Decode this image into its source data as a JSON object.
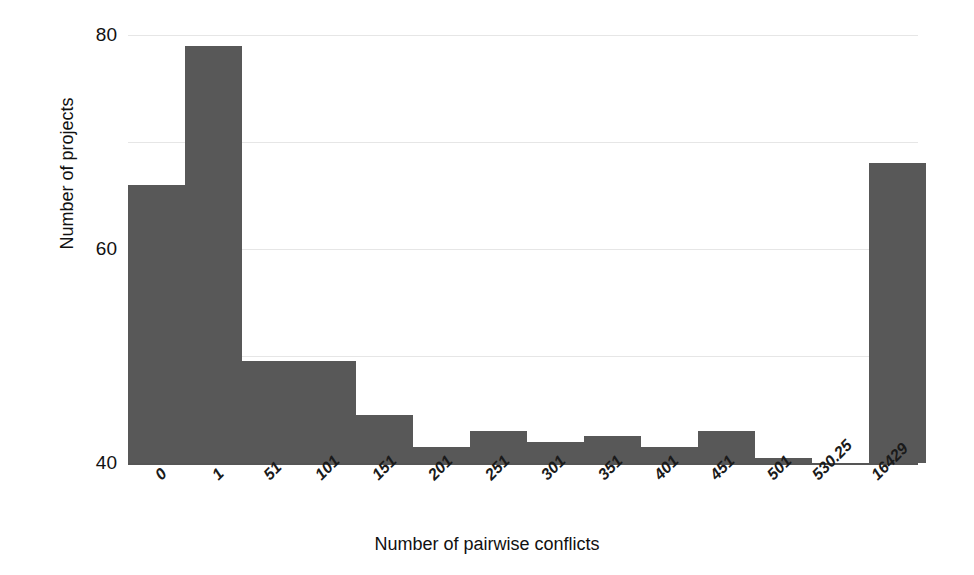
{
  "chart_data": {
    "type": "bar",
    "title": "",
    "subtitle": "",
    "xlabel": "Number of pairwise conflicts",
    "ylabel": "Number of projects",
    "categories": [
      "0",
      "1",
      "51",
      "101",
      "151",
      "201",
      "251",
      "301",
      "351",
      "401",
      "451",
      "501",
      "530.25",
      "16429"
    ],
    "values": [
      52,
      78,
      19,
      19,
      9,
      3,
      6,
      4,
      5,
      3,
      6,
      1,
      0,
      56
    ],
    "series": [
      {
        "name": "Number of projects",
        "values": [
          52,
          78,
          19,
          19,
          9,
          3,
          6,
          4,
          5,
          3,
          6,
          1,
          0,
          56
        ]
      }
    ],
    "ylim": [
      0,
      80
    ],
    "yticks": [
      0,
      20,
      40,
      60,
      80
    ],
    "ytick_labels": [
      "0",
      "20",
      "40",
      "60",
      "80"
    ],
    "xlim": [
      0,
      14
    ],
    "grid": "horizontal",
    "legend": "none",
    "bar_color": "#585858",
    "gridline_color": "#e6e6e6",
    "axis_color": "#555555",
    "background_color": "#ffffff",
    "xtick_rotation": -45,
    "annotations": []
  }
}
